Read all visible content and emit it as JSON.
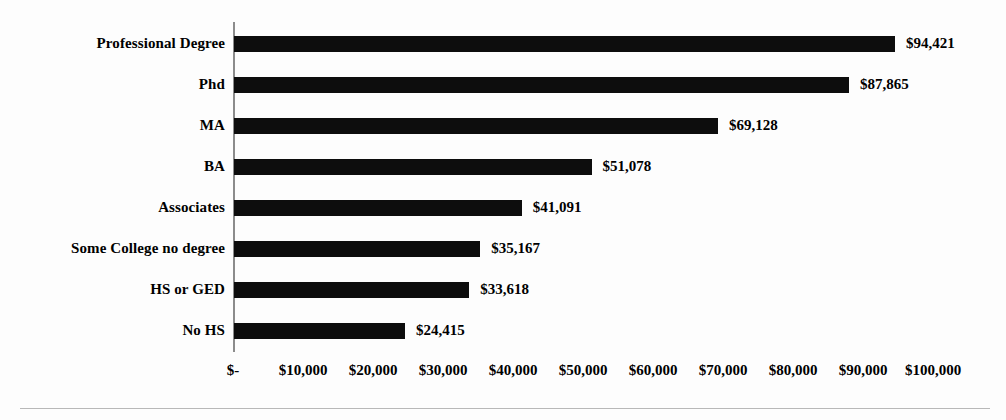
{
  "chart_data": {
    "type": "bar",
    "orientation": "horizontal",
    "title": "",
    "subtitle": "",
    "xlabel": "",
    "ylabel": "",
    "grid": false,
    "legend": null,
    "xlim": [
      0,
      100000
    ],
    "categories": [
      "Professional Degree",
      "Phd",
      "MA",
      "BA",
      "Associates",
      "Some College no degree",
      "HS or GED",
      "No HS"
    ],
    "values": [
      94421,
      87865,
      69128,
      51078,
      41091,
      35167,
      33618,
      24415
    ],
    "value_labels": [
      "$94,421",
      "$87,865",
      "$69,128",
      "$51,078",
      "$41,091",
      "$35,167",
      "$33,618",
      "$24,415"
    ],
    "x_ticks": [
      0,
      10000,
      20000,
      30000,
      40000,
      50000,
      60000,
      70000,
      80000,
      90000,
      100000
    ],
    "x_tick_labels": [
      "$-",
      "$10,000",
      "$20,000",
      "$30,000",
      "$40,000",
      "$50,000",
      "$60,000",
      "$70,000",
      "$80,000",
      "$90,000",
      "$100,000"
    ],
    "bar_color": "#0d0d0d",
    "axis_color": "#8c8c8c",
    "background_color": "#fdfdfd"
  }
}
